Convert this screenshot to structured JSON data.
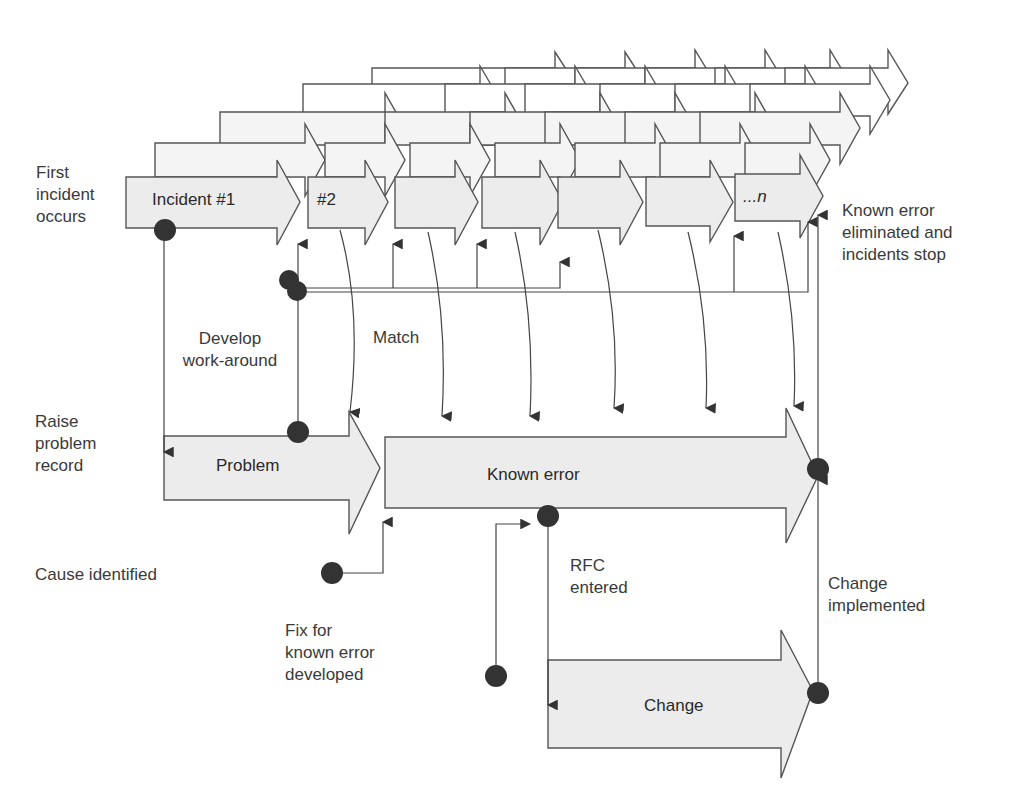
{
  "colors": {
    "fill": "#ececec",
    "stroke": "#555555",
    "dot": "#333333",
    "background": "#ffffff"
  },
  "arrows": {
    "incident_first": "Incident #1",
    "incident_second": "#2",
    "incident_last": "...n",
    "problem": "Problem",
    "known_error": "Known error",
    "change": "Change"
  },
  "annotations": {
    "first_incident": [
      "First",
      "incident",
      "occurs"
    ],
    "known_error_eliminated": [
      "Known error",
      "eliminated and",
      "incidents stop"
    ],
    "develop_workaround": [
      "Develop",
      "work-around"
    ],
    "match": "Match",
    "raise_problem": [
      "Raise",
      "problem",
      "record"
    ],
    "cause_identified": "Cause identified",
    "fix_developed": [
      "Fix for",
      "known error",
      "developed"
    ],
    "rfc_entered": [
      "RFC",
      "entered"
    ],
    "change_implemented": [
      "Change",
      "implemented"
    ]
  }
}
